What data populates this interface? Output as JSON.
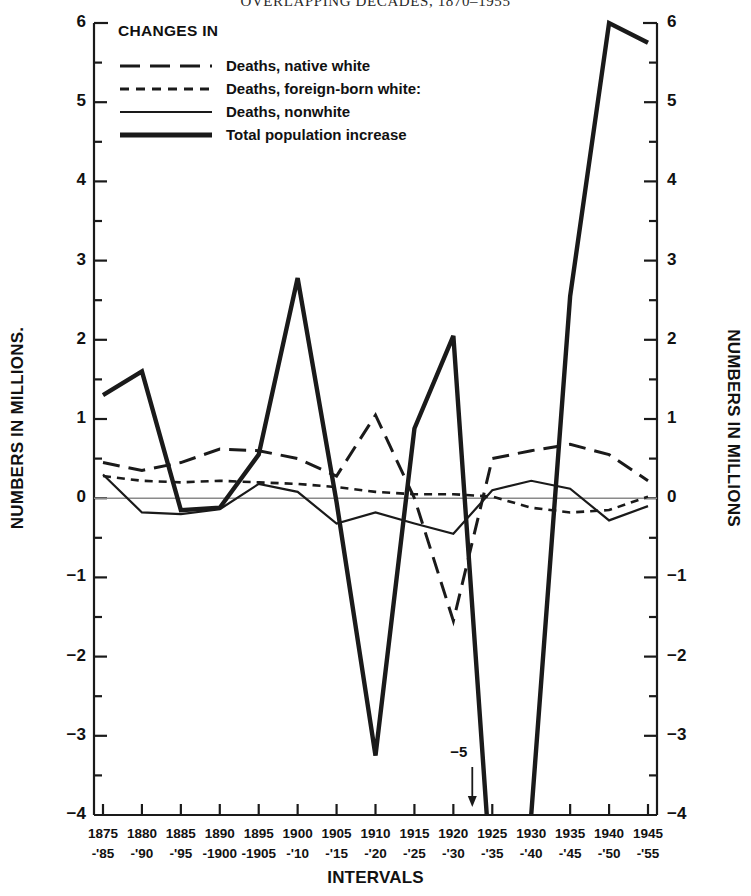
{
  "title": "OVERLAPPING DECADES, 1870–1955",
  "legend": {
    "heading": "CHANGES IN",
    "items": [
      {
        "label": "Deaths, native white",
        "style": "long-dash"
      },
      {
        "label": "Deaths, foreign-born white:",
        "style": "short-dash"
      },
      {
        "label": "Deaths, nonwhite",
        "style": "thin-solid"
      },
      {
        "label": "Total population increase",
        "style": "thick-solid"
      }
    ]
  },
  "axes": {
    "ylabel_left": "NUMBERS IN MILLIONS.",
    "ylabel_right": "NUMBERS IN MILLIONS",
    "xlabel": "INTERVALS",
    "yticks": [
      "6",
      "5",
      "4",
      "3",
      "2",
      "1",
      "0",
      "−1",
      "−2",
      "−3",
      "−4"
    ]
  },
  "annotations": [
    {
      "name": "total-population-offscale",
      "text": "−5",
      "at_category": "1925-'35"
    }
  ],
  "chart_data": {
    "type": "line",
    "title": "OVERLAPPING DECADES, 1870–1955",
    "xlabel": "INTERVALS",
    "ylabel": "NUMBERS IN MILLIONS",
    "ylim": [
      -4,
      6
    ],
    "grid": false,
    "zero_line": true,
    "legend_position": "top-left",
    "categories": [
      "1875-'85",
      "1880-'90",
      "1885-'95",
      "1890-1900",
      "1895-1905",
      "1900-'10",
      "1905-'15",
      "1910-'20",
      "1915-'25",
      "1920-'30",
      "1925-'35",
      "1930-'40",
      "1935-'45",
      "1940-'50",
      "1945-'55"
    ],
    "categories_line1": [
      "1875",
      "1880",
      "1885",
      "1890",
      "1895",
      "1900",
      "1905",
      "1910",
      "1915",
      "1920",
      "1925",
      "1930",
      "1935",
      "1940",
      "1945"
    ],
    "categories_line2": [
      "-'85",
      "-'90",
      "-'95",
      "-1900",
      "-1905",
      "-'10",
      "-'15",
      "-'20",
      "-'25",
      "-'30",
      "-'35",
      "-'40",
      "-'45",
      "-'50",
      "-'55"
    ],
    "series": [
      {
        "name": "Deaths, native white",
        "style": "long-dash",
        "values": [
          0.45,
          0.35,
          0.45,
          0.62,
          0.6,
          0.5,
          0.28,
          1.05,
          0.0,
          -1.55,
          0.5,
          0.6,
          0.68,
          0.55,
          0.22
        ]
      },
      {
        "name": "Deaths, foreign-born white:",
        "style": "short-dash",
        "values": [
          0.28,
          0.22,
          0.2,
          0.22,
          0.2,
          0.18,
          0.14,
          0.08,
          0.05,
          0.05,
          0.02,
          -0.12,
          -0.18,
          -0.15,
          0.02
        ]
      },
      {
        "name": "Deaths, nonwhite",
        "style": "thin-solid",
        "values": [
          0.3,
          -0.18,
          -0.2,
          -0.14,
          0.18,
          0.08,
          -0.32,
          -0.18,
          -0.32,
          -0.45,
          0.1,
          0.22,
          0.12,
          -0.28,
          -0.1
        ]
      },
      {
        "name": "Total population increase",
        "style": "thick-solid",
        "values": [
          1.3,
          1.6,
          -0.15,
          -0.12,
          0.55,
          2.78,
          -0.05,
          -3.25,
          0.88,
          2.05,
          -5.0,
          -4.0,
          2.55,
          6.0,
          5.75
        ]
      }
    ]
  }
}
